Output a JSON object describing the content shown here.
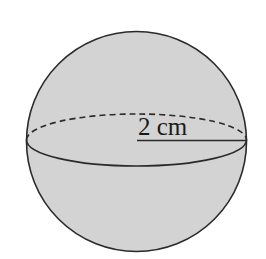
{
  "diagram": {
    "shape": "sphere",
    "radius_label": "2 cm",
    "colors": {
      "fill": "#d3d3d3",
      "stroke": "#2a2a2a",
      "background": "#ffffff"
    }
  }
}
